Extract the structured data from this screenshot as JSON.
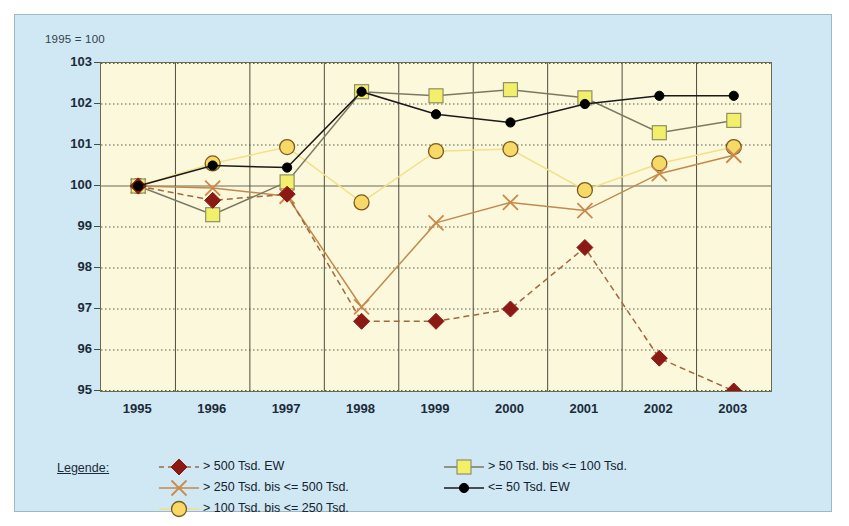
{
  "note": "1995 = 100",
  "legend": {
    "title": "Legende:",
    "entries": [
      {
        "label": "> 500 Tsd. EW",
        "marker": "diamond",
        "color": "#8b1a14",
        "line": "dashed",
        "line_color": "#a06a3c"
      },
      {
        "label": "> 250 Tsd. bis <= 500 Tsd.",
        "marker": "cross",
        "color": "#c98a4b",
        "line": "solid",
        "line_color": "#c08a4e"
      },
      {
        "label": "> 100 Tsd. bis <= 250 Tsd.",
        "marker": "circle",
        "color": "#f7d967",
        "line": "solid",
        "line_color": "#f2e08a"
      },
      {
        "label": "> 50 Tsd. bis <= 100 Tsd.",
        "marker": "square",
        "color": "#f2f06a",
        "line": "solid",
        "line_color": "#7a7a62"
      },
      {
        "label": "<= 50 Tsd. EW",
        "marker": "dot",
        "color": "#000000",
        "line": "solid",
        "line_color": "#1a1a1a"
      }
    ]
  },
  "chart_data": {
    "type": "line",
    "title": "",
    "subtitle": "1995 = 100",
    "xlabel": "",
    "ylabel": "",
    "x": [
      1995,
      1996,
      1997,
      1998,
      1999,
      2000,
      2001,
      2002,
      2003
    ],
    "categories": [
      "1995",
      "1996",
      "1997",
      "1998",
      "1999",
      "2000",
      "2001",
      "2002",
      "2003"
    ],
    "ylim": [
      95,
      103
    ],
    "yticks": [
      95,
      96,
      97,
      98,
      99,
      100,
      101,
      102,
      103
    ],
    "grid": true,
    "legend_position": "bottom",
    "reference_line": 100,
    "series": [
      {
        "name": "> 500 Tsd. EW",
        "marker": "diamond",
        "marker_color": "#8b1a14",
        "line_color": "#a06a3c",
        "line_style": "dashed",
        "values": [
          100.0,
          99.65,
          99.8,
          96.7,
          96.7,
          97.0,
          98.5,
          95.8,
          95.0
        ]
      },
      {
        "name": "> 250 Tsd. bis <= 500 Tsd.",
        "marker": "cross",
        "marker_color": "#c98a4b",
        "line_color": "#c08a4e",
        "line_style": "solid",
        "values": [
          100.0,
          99.95,
          99.75,
          97.05,
          99.1,
          99.6,
          99.4,
          100.3,
          100.75
        ]
      },
      {
        "name": "> 100 Tsd. bis <= 250 Tsd.",
        "marker": "circle",
        "marker_color": "#f7d967",
        "line_color": "#f2e08a",
        "line_style": "solid",
        "values": [
          100.0,
          100.55,
          100.95,
          99.6,
          100.85,
          100.9,
          99.9,
          100.55,
          100.95
        ]
      },
      {
        "name": "> 50 Tsd. bis <= 100 Tsd.",
        "marker": "square",
        "marker_color": "#f2f06a",
        "line_color": "#7a7a62",
        "line_style": "solid",
        "values": [
          100.0,
          99.3,
          100.1,
          102.3,
          102.2,
          102.35,
          102.15,
          101.3,
          101.6
        ]
      },
      {
        "name": "<= 50 Tsd. EW",
        "marker": "dot",
        "marker_color": "#000000",
        "line_color": "#1a1a1a",
        "line_style": "solid",
        "values": [
          100.0,
          100.5,
          100.45,
          102.3,
          101.75,
          101.55,
          102.0,
          102.2,
          102.2
        ]
      }
    ]
  }
}
